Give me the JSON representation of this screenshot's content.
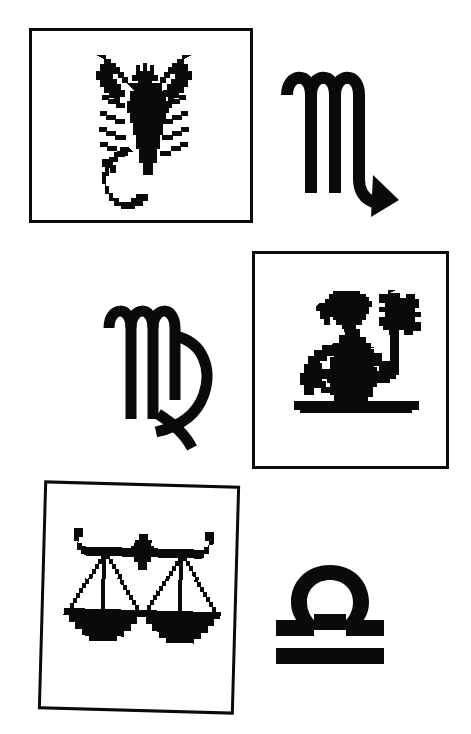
{
  "page": {
    "background_color": "#ffffff",
    "ink_color": "#0a0a0a",
    "width": 471,
    "height": 734
  },
  "items": [
    {
      "id": "scorpion-frame",
      "kind": "framed-illustration",
      "icon_name": "scorpion-icon",
      "subject": "scorpion",
      "sign": "Scorpio",
      "caption": "",
      "row": 1,
      "column": "left",
      "frame": {
        "x": 29,
        "y": 28,
        "width": 224,
        "height": 195,
        "border_px": 3,
        "rotation_deg": 0
      }
    },
    {
      "id": "scorpio-glyph",
      "kind": "astrological-glyph",
      "icon_name": "scorpio-glyph-icon",
      "sign": "Scorpio",
      "symbol": "♏",
      "caption": "",
      "row": 1,
      "column": "right",
      "bounds": {
        "x": 277,
        "y": 57,
        "width": 126,
        "height": 175
      }
    },
    {
      "id": "virgo-glyph",
      "kind": "astrological-glyph",
      "icon_name": "virgo-glyph-icon",
      "sign": "Virgo",
      "symbol": "♍",
      "caption": "",
      "row": 2,
      "column": "left",
      "bounds": {
        "x": 100,
        "y": 292,
        "width": 122,
        "height": 160
      }
    },
    {
      "id": "maiden-frame",
      "kind": "framed-illustration",
      "icon_name": "maiden-with-flower-icon",
      "subject": "maiden holding a flower",
      "sign": "Virgo",
      "caption": "",
      "row": 2,
      "column": "right",
      "frame": {
        "x": 252,
        "y": 251,
        "width": 197,
        "height": 218,
        "border_px": 3,
        "rotation_deg": 0
      }
    },
    {
      "id": "scales-frame",
      "kind": "framed-illustration",
      "icon_name": "balance-scales-icon",
      "subject": "balance scales",
      "sign": "Libra",
      "caption": "",
      "row": 3,
      "column": "left",
      "frame": {
        "x": 41,
        "y": 483,
        "width": 196,
        "height": 229,
        "border_px": 3,
        "rotation_deg": 1.6
      }
    },
    {
      "id": "libra-glyph",
      "kind": "astrological-glyph",
      "icon_name": "libra-glyph-icon",
      "sign": "Libra",
      "symbol": "♎",
      "caption": "",
      "row": 3,
      "column": "right",
      "bounds": {
        "x": 272,
        "y": 562,
        "width": 116,
        "height": 103
      }
    }
  ]
}
